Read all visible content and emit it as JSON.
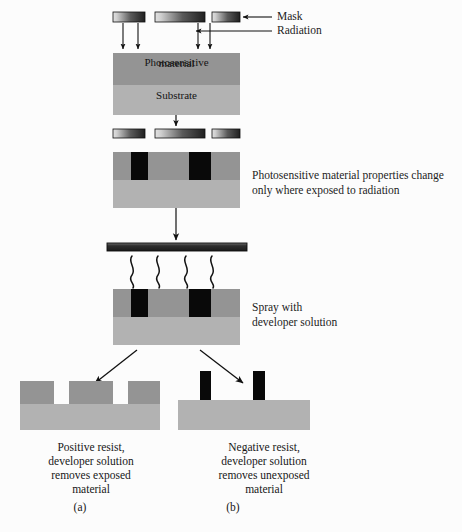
{
  "figure": {
    "width": 462,
    "height": 532
  },
  "colors": {
    "mask_light": "#d8d8d8",
    "mask_dark": "#2b2b2b",
    "photosensitive": "#949494",
    "substrate": "#b2b2b2",
    "exposed": "#090909",
    "spray_bar_dark": "#3a3a3a",
    "spray_bar_light": "#8f8f8f",
    "arrow": "#111111",
    "background": "#fcfcfc",
    "text": "#1a1a1a"
  },
  "annotations": {
    "mask_label": "Mask",
    "radiation_label": "Radiation",
    "exposure_note_line1": "Photosensitive material properties change",
    "exposure_note_line2": "only where exposed to radiation",
    "spray_note_line1": "Spray  with",
    "spray_note_line2": "developer solution"
  },
  "stack_labels": {
    "photosensitive_line1": "Photosensitive",
    "photosensitive_line2": "material",
    "substrate": "Substrate"
  },
  "results": {
    "positive": {
      "caption_line1": "Positive resist,",
      "caption_line2": "developer solution",
      "caption_line3": "removes exposed",
      "caption_line4": "material",
      "subfigure": "(a)"
    },
    "negative": {
      "caption_line1": "Negative resist,",
      "caption_line2": "developer solution",
      "caption_line3": "removes unexposed",
      "caption_line4": "material",
      "subfigure": "(b)"
    }
  },
  "geometry": {
    "mask_bars_top": [
      {
        "x": 113,
        "y": 12,
        "w": 32,
        "h": 10
      },
      {
        "x": 155,
        "y": 12,
        "w": 50,
        "h": 10
      },
      {
        "x": 212,
        "y": 12,
        "w": 28,
        "h": 10
      }
    ],
    "mask_bars_mid": [
      {
        "x": 113,
        "y": 128,
        "w": 32,
        "h": 9
      },
      {
        "x": 155,
        "y": 128,
        "w": 50,
        "h": 9
      },
      {
        "x": 212,
        "y": 128,
        "w": 28,
        "h": 9
      }
    ],
    "radiation_arrows_x": [
      123,
      138,
      198,
      210
    ],
    "stack1": {
      "x": 113,
      "y": 53,
      "w": 127,
      "h": 62,
      "split": 32
    },
    "stack2": {
      "x": 113,
      "y": 152,
      "w": 127,
      "h": 56,
      "split": 28
    },
    "stack3": {
      "x": 113,
      "y": 289,
      "w": 127,
      "h": 56,
      "split": 28
    },
    "exposed_regions": [
      {
        "x": 131,
        "y": 0,
        "w": 17,
        "h": 28
      },
      {
        "x": 189,
        "y": 0,
        "w": 22,
        "h": 28
      }
    ],
    "spray_bar": {
      "x": 107,
      "y": 243,
      "w": 140,
      "h": 8
    },
    "squiggle_x": [
      132,
      158,
      186,
      212
    ],
    "positive_result": {
      "x": 20,
      "y": 380,
      "w": 140,
      "h": 48
    },
    "positive_features": [
      {
        "x": 0,
        "w": 34
      },
      {
        "x": 49,
        "w": 44
      },
      {
        "x": 108,
        "w": 32
      }
    ],
    "negative_result": {
      "x": 178,
      "y": 400,
      "w": 132,
      "h": 30
    },
    "negative_pillars": [
      {
        "x": 22,
        "w": 11,
        "h": 30
      },
      {
        "x": 75,
        "w": 12,
        "h": 30
      }
    ]
  }
}
